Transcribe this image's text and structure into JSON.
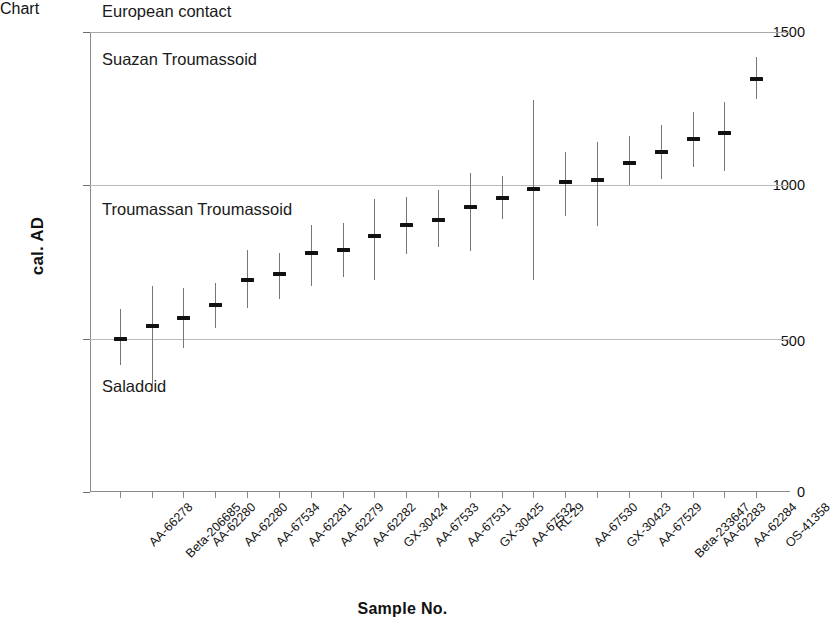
{
  "chart_data": {
    "type": "scatter",
    "title": "",
    "xlabel": "Sample No.",
    "ylabel": "cal. AD",
    "ylim": [
      0,
      1500
    ],
    "yticks": [
      0,
      500,
      1000,
      1500
    ],
    "ytick_labels": [
      "0",
      "500",
      "1000",
      "1500"
    ],
    "grid": true,
    "gridlines_at": [
      500,
      1000,
      1500
    ],
    "legend": "none",
    "annotations": [
      {
        "text": "European contact",
        "y_approx": 1530,
        "note": "above plot top border"
      },
      {
        "text": "Suazan Troumassoid",
        "y_approx": 1400,
        "note": "upper band"
      },
      {
        "text": "Troumassan Troumassoid",
        "y_approx": 915,
        "note": "middle band"
      },
      {
        "text": "Saladoid",
        "y_approx": 380,
        "note": "lower band"
      }
    ],
    "categories": [
      "AA-66278",
      "Beta-206685",
      "AA-62280",
      "AA-62280",
      "AA-67534",
      "AA-62281",
      "AA-62279",
      "AA-62282",
      "GX-30424",
      "AA-67533",
      "AA-67531",
      "GX-30425",
      "AA-67532",
      "RL-29",
      "AA-67530",
      "GX-30423",
      "AA-67529",
      "Beta-233647",
      "AA-62283",
      "AA-62284",
      "OS-41358"
    ],
    "series": [
      {
        "name": "calibrated radiocarbon date (median with 2-sigma range)",
        "points": [
          {
            "label": "AA-66278",
            "median": 498,
            "low": 413,
            "high": 598
          },
          {
            "label": "Beta-206685",
            "median": 540,
            "low": 330,
            "high": 672
          },
          {
            "label": "AA-62280",
            "median": 568,
            "low": 470,
            "high": 665
          },
          {
            "label": "AA-62280",
            "median": 610,
            "low": 535,
            "high": 682
          },
          {
            "label": "AA-67534",
            "median": 692,
            "low": 600,
            "high": 790
          },
          {
            "label": "AA-62281",
            "median": 710,
            "low": 628,
            "high": 780
          },
          {
            "label": "AA-62279",
            "median": 778,
            "low": 672,
            "high": 872
          },
          {
            "label": "AA-62282",
            "median": 790,
            "low": 700,
            "high": 878
          },
          {
            "label": "GX-30424",
            "median": 835,
            "low": 690,
            "high": 955
          },
          {
            "label": "AA-67533",
            "median": 872,
            "low": 775,
            "high": 962
          },
          {
            "label": "AA-67531",
            "median": 888,
            "low": 800,
            "high": 985
          },
          {
            "label": "GX-30425",
            "median": 928,
            "low": 785,
            "high": 1040
          },
          {
            "label": "AA-67532",
            "median": 960,
            "low": 890,
            "high": 1030
          },
          {
            "label": "RL-29",
            "median": 988,
            "low": 692,
            "high": 1278
          },
          {
            "label": "AA-67530",
            "median": 1012,
            "low": 900,
            "high": 1108
          },
          {
            "label": "GX-30423",
            "median": 1018,
            "low": 868,
            "high": 1140
          },
          {
            "label": "AA-67529",
            "median": 1072,
            "low": 1000,
            "high": 1162
          },
          {
            "label": "Beta-233647",
            "median": 1108,
            "low": 1020,
            "high": 1198
          },
          {
            "label": "AA-62283",
            "median": 1152,
            "low": 1060,
            "high": 1240
          },
          {
            "label": "AA-62284",
            "median": 1172,
            "low": 1048,
            "high": 1272
          },
          {
            "label": "OS-41358",
            "median": 1348,
            "low": 1280,
            "high": 1418
          }
        ]
      }
    ]
  },
  "axes": {
    "y_title": "cal. AD",
    "x_title": "Sample No.",
    "y_tick_labels": [
      "1500",
      "1000",
      "500",
      "0"
    ]
  },
  "bands": {
    "european_contact": "European contact",
    "suazan": "Suazan Troumassoid",
    "troumassan": "Troumassan Troumassoid",
    "saladoid": "Saladoid"
  }
}
